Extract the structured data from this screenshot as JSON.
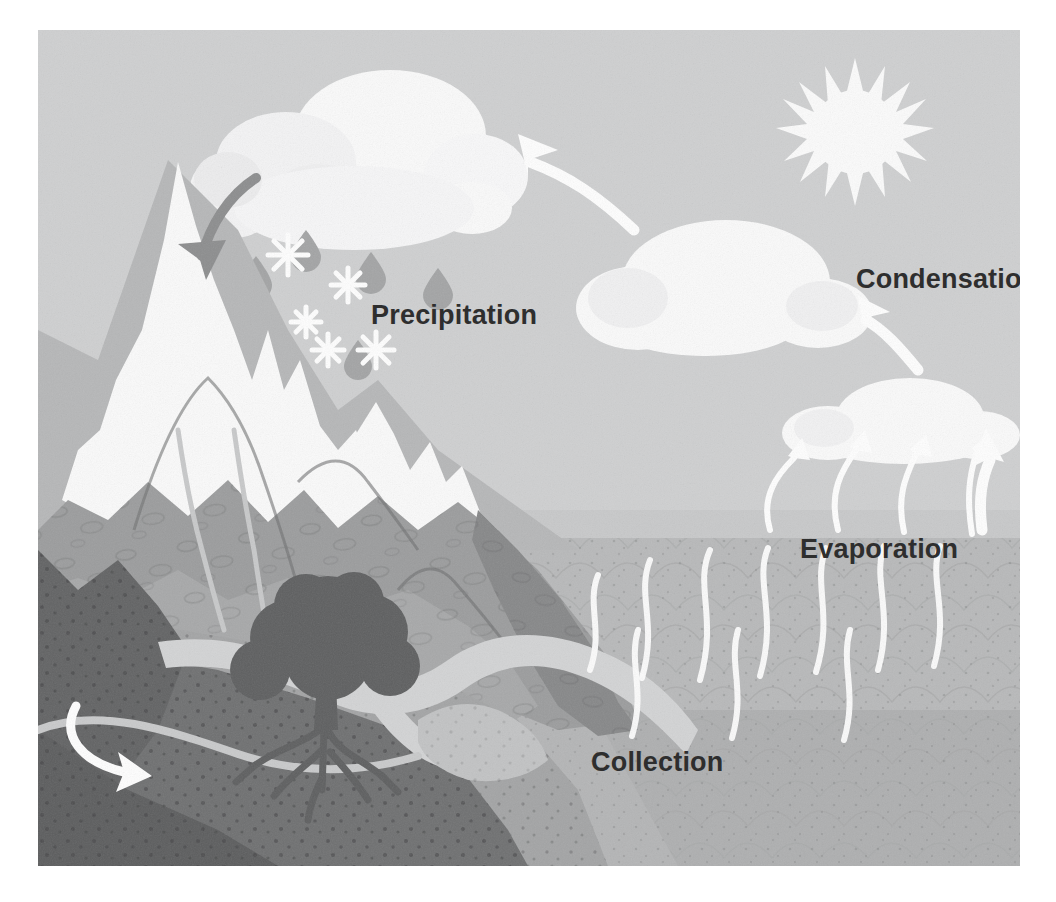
{
  "illustration": {
    "title": "The Water Cycle",
    "type": "water-cycle-diagram",
    "style": "flat textured illustration, grayscale"
  },
  "labels": {
    "precipitation": "Precipitation",
    "condensation": "Condensation",
    "evaporation": "Evaporation",
    "collection": "Collection"
  },
  "colors": {
    "page_background": "#ffffff",
    "sky": "#cfd0d1",
    "sky_lower": "#c3c4c5",
    "cloud": "#fbfbfb",
    "cloud_shadow": "#ededee",
    "sun": "#fcfcfc",
    "snow": "#fbfbfb",
    "mountain_light": "#b3b4b5",
    "mountain_mid": "#9c9d9e",
    "mountain_dark": "#868788",
    "ground_light": "#a9aaab",
    "ground_mid": "#949596",
    "ground_dark": "#6e6f70",
    "ground_darkest": "#616263",
    "ocean_upper": "#b8b9ba",
    "ocean_lower": "#a6a7a8",
    "river": "#d3d4d5",
    "tree": "#5d5e5f",
    "arrow_white": "#ffffff",
    "arrow_gray": "#8c8d8e",
    "raindrop": "#a3a4a5",
    "snowflake": "#ffffff",
    "label_text": "#2e2e2e"
  },
  "elements": {
    "sun": {
      "name": "sun",
      "rays": 16,
      "center_x": 855,
      "center_y": 130,
      "radius": 72
    },
    "clouds": [
      {
        "name": "precipitation-cloud",
        "x": 215,
        "y": 60,
        "width": 310,
        "height": 165
      },
      {
        "name": "condensation-cloud",
        "x": 555,
        "y": 190,
        "width": 270,
        "height": 120
      },
      {
        "name": "evaporation-cloud",
        "x": 750,
        "y": 355,
        "width": 250,
        "height": 88
      }
    ],
    "arrows": [
      {
        "name": "arrow-to-precipitation-cloud",
        "direction": "up-left",
        "color": "white",
        "stage": "transport"
      },
      {
        "name": "arrow-snowfall-to-mountain",
        "direction": "down-left",
        "color": "gray",
        "stage": "precipitation"
      },
      {
        "name": "arrow-condensation-rising",
        "direction": "up-left",
        "color": "white",
        "stage": "condensation"
      },
      {
        "name": "arrow-evaporation-1",
        "direction": "up",
        "color": "white",
        "stage": "evaporation"
      },
      {
        "name": "arrow-evaporation-2",
        "direction": "up",
        "color": "white",
        "stage": "evaporation"
      },
      {
        "name": "arrow-evaporation-3",
        "direction": "up",
        "color": "white",
        "stage": "evaporation"
      },
      {
        "name": "arrow-evaporation-4",
        "direction": "up",
        "color": "white",
        "stage": "evaporation"
      },
      {
        "name": "arrow-groundwater-flow",
        "direction": "right",
        "color": "white",
        "stage": "collection"
      }
    ],
    "precipitation": {
      "raindrops": 8,
      "snowflakes": 5
    },
    "terrain": {
      "mountains": 3,
      "snow_caps": true,
      "tree": {
        "name": "tree",
        "roots_visible": true
      },
      "river": true,
      "ocean": true,
      "groundwater_layer": true
    },
    "water_vapor_streaks": 10
  }
}
